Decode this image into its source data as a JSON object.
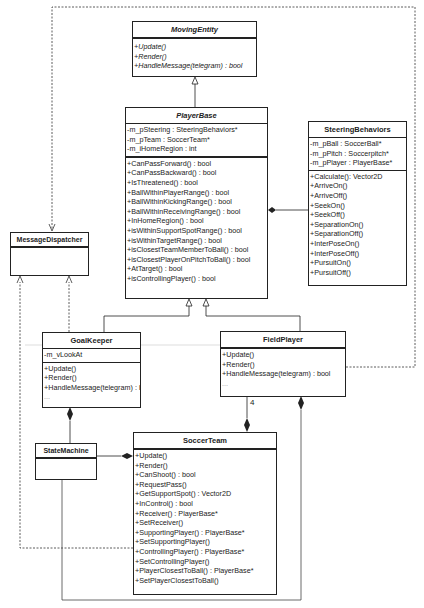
{
  "classes": {
    "moving_entity": {
      "name": "MovingEntity",
      "attributes": [],
      "operations": [
        "+Update()",
        "+Render()",
        "+HandleMessage(telegram) : bool"
      ]
    },
    "player_base": {
      "name": "PlayerBase",
      "attributes": [
        "-m_pSteering : SteeringBehaviors*",
        "-m_pTeam : SoccerTeam*",
        "-m_iHomeRegion : int"
      ],
      "operations": [
        "+CanPassForward() : bool",
        "+CanPassBackward() : bool",
        "+IsThreatened() : bool",
        "+BallWithinPlayerRange() : bool",
        "+BallWithinKickingRange() : bool",
        "+BallWithinReceivingRange() : bool",
        "+InHomeRegion() : bool",
        "+isWithinSupportSpotRange() : bool",
        "+isWithinTargetRange() : bool",
        "+isClosestTeamMemberToBall() : bool",
        "+isClosestPlayerOnPitchToBall() : bool",
        "+AtTarget() : bool",
        "+isControllingPlayer() : bool"
      ]
    },
    "steering_behaviors": {
      "name": "SteeringBehaviors",
      "attributes": [
        "-m_pBall : SoccerBall*",
        "-m_pPitch : Soccerpitch*",
        "-m_pPlayer : PlayerBase*"
      ],
      "operations": [
        "+Calculate(): Vector2D",
        "+ArriveOn()",
        "+ArriveOff()",
        "+SeekOn()",
        "+SeekOff()",
        "+SeparationOn()",
        "+SeparationOff()",
        "+InterPoseOn()",
        "+InterPoseOff()",
        "+PursuitOn()",
        "+PursuitOff()"
      ]
    },
    "message_dispatcher": {
      "name": "MessageDispatcher",
      "attributes": [],
      "operations": []
    },
    "goal_keeper": {
      "name": "GoalKeeper",
      "attributes": [
        "-m_vLookAt"
      ],
      "operations": [
        "+Update()",
        "+Render()",
        "+HandleMessage(telegram) : bool",
        "..."
      ]
    },
    "field_player": {
      "name": "FieldPlayer",
      "attributes": [],
      "operations": [
        "+Update()",
        "+Render()",
        "+HandleMessage(telegram) : bool",
        "..."
      ]
    },
    "state_machine": {
      "name": "StateMachine",
      "attributes": [],
      "operations": []
    },
    "soccer_team": {
      "name": "SoccerTeam",
      "attributes": [],
      "operations": [
        "+Update()",
        "+Render()",
        "+CanShoot() : bool",
        "+RequestPass()",
        "+GetSupportSpot() : Vector2D",
        "+InControl() : bool",
        "+Receiver() : PlayerBase*",
        "+SetReceiver()",
        "+SupportingPlayer() : PlayerBase*",
        "+SetSupportingPlayer()",
        "+ControllingPlayer() : PlayerBase*",
        "+SetControllingPlayer()",
        "+PlayerClosestToBall() : PlayerBase*",
        "+SetPlayerClosestToBall()"
      ]
    }
  },
  "multiplicities": {
    "field_player_to_team": "4"
  },
  "colors": {
    "line": "#222222",
    "dependency": "#333333",
    "background": "#ffffff"
  }
}
